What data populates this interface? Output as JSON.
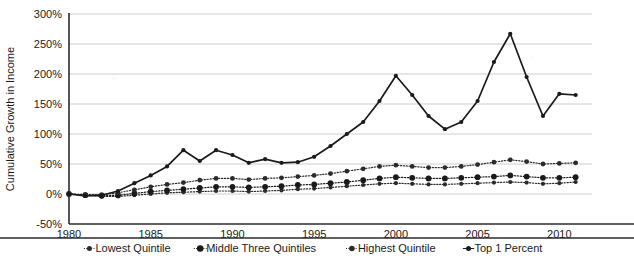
{
  "chart_data": {
    "type": "line",
    "title": "",
    "xlabel": "",
    "ylabel": "Cumulative Growth in Income",
    "xlim": [
      1980,
      2012
    ],
    "ylim": [
      -50,
      300
    ],
    "grid": true,
    "legend_position": "bottom",
    "y_tick_labels": [
      "300%",
      "250%",
      "200%",
      "150%",
      "100%",
      "50%",
      "0%",
      "-50%"
    ],
    "y_ticks": [
      300,
      250,
      200,
      150,
      100,
      50,
      0,
      -50
    ],
    "x_tick_labels": [
      "1980",
      "1985",
      "1990",
      "1995",
      "2000",
      "2005",
      "2010"
    ],
    "x_ticks": [
      1980,
      1985,
      1990,
      1995,
      2000,
      2005,
      2010
    ],
    "x": [
      1980,
      1981,
      1982,
      1983,
      1984,
      1985,
      1986,
      1987,
      1988,
      1989,
      1990,
      1991,
      1992,
      1993,
      1994,
      1995,
      1996,
      1997,
      1998,
      1999,
      2000,
      2001,
      2002,
      2003,
      2004,
      2005,
      2006,
      2007,
      2008,
      2009,
      2010,
      2011
    ],
    "series": [
      {
        "name": "Lowest Quintile",
        "marker": "small-dot",
        "line_style": "dotted",
        "color": "#2b2b2b",
        "values": [
          0,
          -2,
          -4,
          -4,
          -2,
          0,
          2,
          3,
          4,
          5,
          5,
          4,
          5,
          6,
          8,
          9,
          11,
          13,
          15,
          17,
          18,
          17,
          16,
          16,
          17,
          18,
          19,
          20,
          19,
          17,
          18,
          20
        ]
      },
      {
        "name": "Middle Three Quintiles",
        "marker": "large-dot",
        "line_style": "dotted",
        "color": "#1a1a1a",
        "values": [
          0,
          -2,
          -3,
          -2,
          1,
          4,
          6,
          8,
          10,
          12,
          12,
          11,
          12,
          13,
          15,
          16,
          18,
          20,
          23,
          26,
          28,
          27,
          26,
          26,
          27,
          28,
          29,
          31,
          29,
          27,
          27,
          28
        ]
      },
      {
        "name": "Highest Quintile",
        "marker": "medium-dot",
        "line_style": "dotted",
        "color": "#2b2b2b",
        "values": [
          0,
          -1,
          -1,
          2,
          7,
          12,
          16,
          19,
          23,
          26,
          26,
          24,
          26,
          27,
          29,
          31,
          34,
          38,
          42,
          46,
          48,
          46,
          44,
          44,
          46,
          49,
          53,
          57,
          54,
          50,
          51,
          52
        ]
      },
      {
        "name": "Top 1 Percent",
        "marker": "small-dot",
        "line_style": "solid",
        "color": "#1a1a1a",
        "values": [
          0,
          -3,
          -2,
          5,
          18,
          31,
          46,
          73,
          55,
          73,
          65,
          52,
          58,
          52,
          53,
          62,
          80,
          100,
          120,
          155,
          197,
          165,
          130,
          108,
          120,
          155,
          220,
          267,
          195,
          130,
          167,
          165
        ]
      }
    ]
  },
  "legend": {
    "items": [
      {
        "label": "Lowest Quintile"
      },
      {
        "label": "Middle Three Quintiles"
      },
      {
        "label": "Highest Quintile"
      },
      {
        "label": "Top 1 Percent"
      }
    ]
  }
}
